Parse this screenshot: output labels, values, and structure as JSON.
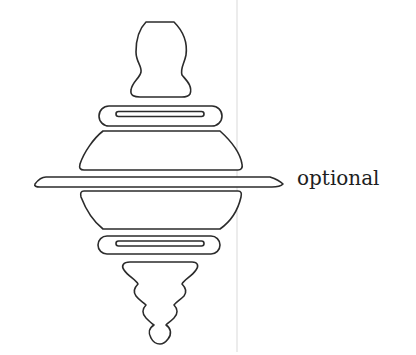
{
  "diagram": {
    "type": "stacked-parts-illustration",
    "colors": {
      "stroke": "#2b2b2b",
      "divider": "#d9d9d9",
      "background": "#ffffff"
    },
    "parts": [
      {
        "id": "top-knob",
        "shape": "gourd"
      },
      {
        "id": "upper-ring",
        "shape": "ring-with-slot"
      },
      {
        "id": "upper-bowl",
        "shape": "trapezoid-bowl"
      },
      {
        "id": "middle-disk",
        "shape": "wide-flat-disk",
        "label": "optional"
      },
      {
        "id": "lower-bowl",
        "shape": "inverted-trapezoid-bowl"
      },
      {
        "id": "lower-ring",
        "shape": "ring-with-slot"
      },
      {
        "id": "bottom-tip",
        "shape": "stepped-cone"
      }
    ],
    "labels": {
      "middle_disk": "optional"
    }
  }
}
